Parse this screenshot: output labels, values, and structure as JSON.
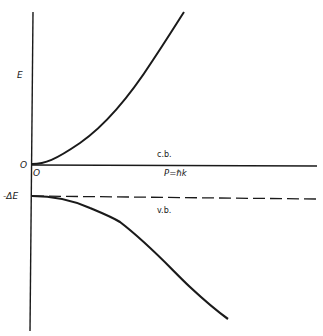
{
  "diagram": {
    "y_axis": {
      "label": "E",
      "ticks": [
        "O",
        "-ΔE"
      ]
    },
    "x_axis": {
      "label": "P=ℏk",
      "origin_label": "O"
    },
    "bands": [
      {
        "name": "c.b.",
        "description": "conduction band, parabola opening upward from E=0"
      },
      {
        "name": "v.b.",
        "description": "valence band, parabola opening downward from E=-ΔE"
      }
    ],
    "reference_line": {
      "style": "dashed",
      "level": "-ΔE"
    }
  },
  "labels": {
    "energy": "E",
    "zero": "O",
    "origin": "O",
    "gap": "-ΔE",
    "momentum": "P=ℏk",
    "cb": "c.b.",
    "vb": "v.b."
  },
  "colors": {
    "ink": "#1a1a1a",
    "background": "#ffffff"
  }
}
